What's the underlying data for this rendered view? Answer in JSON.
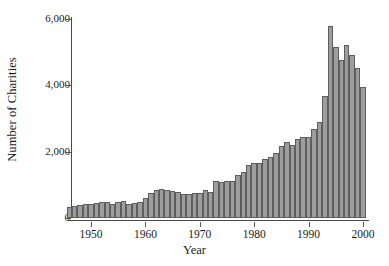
{
  "chart_data": {
    "type": "bar",
    "title": "",
    "xlabel": "Year",
    "ylabel": "Number of Charities",
    "xlim": [
      1945.2,
      2001.2
    ],
    "ylim": [
      0,
      6000
    ],
    "grid": false,
    "legend": null,
    "ytick_labels": [
      "0",
      "2,000",
      "4,000",
      "6,000"
    ],
    "ytick_values": [
      0,
      2000,
      4000,
      6000
    ],
    "xtick_labels": [
      "1950",
      "1960",
      "1970",
      "1980",
      "1990",
      "2000"
    ],
    "xtick_values": [
      1950,
      1960,
      1970,
      1980,
      1990,
      2000
    ],
    "bar_fill_color": "#9d9d9d",
    "bar_edge_color": "#5e5e5e",
    "axis_color": "#4a4a4a",
    "categories": [
      1946,
      1947,
      1948,
      1949,
      1950,
      1951,
      1952,
      1953,
      1954,
      1955,
      1956,
      1957,
      1958,
      1959,
      1960,
      1961,
      1962,
      1963,
      1964,
      1965,
      1966,
      1967,
      1968,
      1969,
      1970,
      1971,
      1972,
      1973,
      1974,
      1975,
      1976,
      1977,
      1978,
      1979,
      1980,
      1981,
      1982,
      1983,
      1984,
      1985,
      1986,
      1987,
      1988,
      1989,
      1990,
      1991,
      1992,
      1993,
      1994,
      1995,
      1996,
      1997,
      1998,
      1999,
      2000
    ],
    "values": [
      330,
      360,
      390,
      410,
      430,
      440,
      470,
      480,
      430,
      480,
      520,
      420,
      440,
      480,
      590,
      760,
      840,
      860,
      840,
      820,
      790,
      720,
      730,
      740,
      760,
      850,
      790,
      1120,
      1080,
      1100,
      1120,
      1300,
      1390,
      1600,
      1650,
      1660,
      1770,
      1840,
      1960,
      2180,
      2290,
      2190,
      2390,
      2430,
      2450,
      2690,
      2890,
      3680,
      5770,
      5140,
      4760,
      5210,
      4910,
      4520,
      3930
    ]
  }
}
